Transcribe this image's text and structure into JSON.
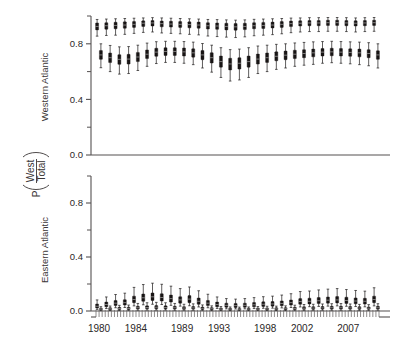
{
  "figure": {
    "axis_title": "P(West/Total)",
    "axis_title_p": "P",
    "axis_title_num": "West",
    "axis_title_den": "Total"
  },
  "chart_data": {
    "type": "box",
    "title": "",
    "xlabel": "",
    "ylabel": "P(West/Total)",
    "grid": false,
    "legend": "none",
    "panels": [
      {
        "id": "western-atlantic",
        "label": "Western Atlantic",
        "ylim": [
          0.0,
          1.0
        ],
        "yticks_major": [
          0.0,
          0.4,
          0.8
        ],
        "yticks_major_labels": [
          "0.0",
          "0.4",
          "0.8"
        ],
        "yticks_minor": [
          0.2,
          0.6,
          1.0
        ],
        "series": [
          {
            "name": "upper band",
            "x": [
              1980,
              1981,
              1982,
              1983,
              1984,
              1985,
              1986,
              1987,
              1988,
              1989,
              1990,
              1991,
              1992,
              1993,
              1994,
              1995,
              1996,
              1997,
              1998,
              1999,
              2000,
              2001,
              2002,
              2003,
              2004,
              2005,
              2006,
              2007,
              2008,
              2009,
              2010
            ],
            "median": [
              0.925,
              0.93,
              0.932,
              0.935,
              0.94,
              0.948,
              0.95,
              0.945,
              0.942,
              0.94,
              0.938,
              0.935,
              0.93,
              0.928,
              0.925,
              0.922,
              0.925,
              0.93,
              0.932,
              0.935,
              0.94,
              0.945,
              0.948,
              0.95,
              0.95,
              0.952,
              0.952,
              0.95,
              0.948,
              0.95,
              0.952
            ],
            "q1": [
              0.9,
              0.905,
              0.908,
              0.912,
              0.918,
              0.925,
              0.928,
              0.922,
              0.92,
              0.918,
              0.915,
              0.912,
              0.906,
              0.904,
              0.9,
              0.898,
              0.902,
              0.908,
              0.91,
              0.914,
              0.918,
              0.924,
              0.928,
              0.93,
              0.93,
              0.932,
              0.932,
              0.93,
              0.928,
              0.93,
              0.932
            ],
            "q3": [
              0.95,
              0.952,
              0.955,
              0.958,
              0.96,
              0.965,
              0.968,
              0.964,
              0.962,
              0.96,
              0.958,
              0.956,
              0.952,
              0.95,
              0.948,
              0.946,
              0.948,
              0.952,
              0.954,
              0.956,
              0.96,
              0.964,
              0.966,
              0.968,
              0.968,
              0.97,
              0.97,
              0.968,
              0.966,
              0.968,
              0.97
            ],
            "low": [
              0.855,
              0.86,
              0.862,
              0.868,
              0.875,
              0.882,
              0.885,
              0.878,
              0.875,
              0.872,
              0.868,
              0.864,
              0.856,
              0.852,
              0.848,
              0.845,
              0.85,
              0.858,
              0.862,
              0.866,
              0.872,
              0.88,
              0.885,
              0.888,
              0.888,
              0.89,
              0.89,
              0.888,
              0.885,
              0.888,
              0.89
            ],
            "high": [
              0.975,
              0.978,
              0.98,
              0.982,
              0.984,
              0.986,
              0.988,
              0.986,
              0.984,
              0.982,
              0.98,
              0.978,
              0.975,
              0.974,
              0.972,
              0.97,
              0.972,
              0.976,
              0.978,
              0.98,
              0.982,
              0.985,
              0.986,
              0.988,
              0.988,
              0.989,
              0.989,
              0.988,
              0.986,
              0.988,
              0.989
            ]
          },
          {
            "name": "lower band",
            "x": [
              1980,
              1981,
              1982,
              1983,
              1984,
              1985,
              1986,
              1987,
              1988,
              1989,
              1990,
              1991,
              1992,
              1993,
              1994,
              1995,
              1996,
              1997,
              1998,
              1999,
              2000,
              2001,
              2002,
              2003,
              2004,
              2005,
              2006,
              2007,
              2008,
              2009,
              2010
            ],
            "median": [
              0.72,
              0.7,
              0.688,
              0.69,
              0.705,
              0.725,
              0.74,
              0.745,
              0.745,
              0.742,
              0.735,
              0.72,
              0.7,
              0.672,
              0.655,
              0.66,
              0.672,
              0.69,
              0.7,
              0.71,
              0.718,
              0.725,
              0.73,
              0.735,
              0.74,
              0.742,
              0.74,
              0.738,
              0.735,
              0.73,
              0.72
            ],
            "q1": [
              0.688,
              0.665,
              0.652,
              0.654,
              0.672,
              0.694,
              0.71,
              0.716,
              0.716,
              0.712,
              0.704,
              0.686,
              0.662,
              0.632,
              0.612,
              0.618,
              0.632,
              0.654,
              0.666,
              0.678,
              0.686,
              0.694,
              0.7,
              0.706,
              0.712,
              0.714,
              0.712,
              0.71,
              0.706,
              0.7,
              0.688
            ],
            "q3": [
              0.752,
              0.734,
              0.722,
              0.724,
              0.738,
              0.756,
              0.768,
              0.772,
              0.772,
              0.77,
              0.764,
              0.752,
              0.736,
              0.712,
              0.696,
              0.7,
              0.712,
              0.726,
              0.734,
              0.742,
              0.748,
              0.754,
              0.758,
              0.762,
              0.766,
              0.768,
              0.766,
              0.764,
              0.762,
              0.758,
              0.75
            ],
            "low": [
              0.628,
              0.6,
              0.582,
              0.586,
              0.608,
              0.638,
              0.658,
              0.666,
              0.666,
              0.66,
              0.65,
              0.626,
              0.596,
              0.558,
              0.532,
              0.54,
              0.558,
              0.586,
              0.6,
              0.616,
              0.626,
              0.638,
              0.646,
              0.652,
              0.66,
              0.664,
              0.66,
              0.656,
              0.65,
              0.642,
              0.626
            ],
            "high": [
              0.8,
              0.788,
              0.778,
              0.78,
              0.79,
              0.805,
              0.815,
              0.818,
              0.818,
              0.816,
              0.812,
              0.802,
              0.79,
              0.772,
              0.758,
              0.762,
              0.772,
              0.784,
              0.79,
              0.796,
              0.8,
              0.806,
              0.81,
              0.814,
              0.816,
              0.818,
              0.816,
              0.814,
              0.812,
              0.808,
              0.8
            ]
          }
        ]
      },
      {
        "id": "eastern-atlantic",
        "label": "Eastern Atlantic",
        "ylim": [
          0.0,
          1.0
        ],
        "yticks_major": [
          0.0,
          0.4,
          0.8
        ],
        "yticks_major_labels": [
          "0.0",
          "0.4",
          "0.8"
        ],
        "yticks_minor": [
          0.2,
          0.6,
          1.0
        ],
        "series": [
          {
            "name": "upper band",
            "x": [
              1980,
              1981,
              1982,
              1983,
              1984,
              1985,
              1986,
              1987,
              1988,
              1989,
              1990,
              1991,
              1992,
              1993,
              1994,
              1995,
              1996,
              1997,
              1998,
              1999,
              2000,
              2001,
              2002,
              2003,
              2004,
              2005,
              2006,
              2007,
              2008,
              2009,
              2010
            ],
            "median": [
              0.035,
              0.048,
              0.058,
              0.062,
              0.085,
              0.098,
              0.105,
              0.1,
              0.092,
              0.082,
              0.088,
              0.072,
              0.058,
              0.048,
              0.042,
              0.04,
              0.042,
              0.046,
              0.05,
              0.052,
              0.056,
              0.062,
              0.07,
              0.072,
              0.076,
              0.08,
              0.082,
              0.078,
              0.074,
              0.072,
              0.085
            ],
            "q1": [
              0.022,
              0.032,
              0.04,
              0.044,
              0.062,
              0.072,
              0.078,
              0.074,
              0.066,
              0.058,
              0.062,
              0.05,
              0.04,
              0.032,
              0.028,
              0.026,
              0.028,
              0.031,
              0.034,
              0.036,
              0.039,
              0.044,
              0.05,
              0.052,
              0.055,
              0.058,
              0.06,
              0.056,
              0.053,
              0.051,
              0.062
            ],
            "q3": [
              0.052,
              0.066,
              0.078,
              0.084,
              0.11,
              0.126,
              0.134,
              0.128,
              0.118,
              0.106,
              0.114,
              0.096,
              0.078,
              0.066,
              0.058,
              0.056,
              0.058,
              0.063,
              0.068,
              0.07,
              0.075,
              0.082,
              0.092,
              0.095,
              0.1,
              0.104,
              0.107,
              0.102,
              0.097,
              0.094,
              0.11
            ],
            "low": [
              0.012,
              0.018,
              0.024,
              0.026,
              0.038,
              0.046,
              0.05,
              0.048,
              0.042,
              0.036,
              0.039,
              0.03,
              0.024,
              0.019,
              0.016,
              0.015,
              0.016,
              0.018,
              0.02,
              0.021,
              0.023,
              0.026,
              0.03,
              0.032,
              0.034,
              0.036,
              0.038,
              0.035,
              0.033,
              0.031,
              0.038
            ],
            "high": [
              0.082,
              0.104,
              0.122,
              0.132,
              0.175,
              0.196,
              0.206,
              0.198,
              0.184,
              0.166,
              0.178,
              0.15,
              0.124,
              0.104,
              0.092,
              0.088,
              0.092,
              0.099,
              0.106,
              0.11,
              0.118,
              0.128,
              0.144,
              0.148,
              0.156,
              0.162,
              0.166,
              0.159,
              0.152,
              0.147,
              0.172
            ]
          },
          {
            "name": "lower band",
            "x": [
              1980,
              1981,
              1982,
              1983,
              1984,
              1985,
              1986,
              1987,
              1988,
              1989,
              1990,
              1991,
              1992,
              1993,
              1994,
              1995,
              1996,
              1997,
              1998,
              1999,
              2000,
              2001,
              2002,
              2003,
              2004,
              2005,
              2006,
              2007,
              2008,
              2009,
              2010
            ],
            "median": [
              0.014,
              0.016,
              0.018,
              0.019,
              0.024,
              0.026,
              0.028,
              0.026,
              0.024,
              0.022,
              0.023,
              0.02,
              0.017,
              0.015,
              0.014,
              0.013,
              0.014,
              0.015,
              0.016,
              0.016,
              0.017,
              0.019,
              0.021,
              0.022,
              0.023,
              0.024,
              0.024,
              0.023,
              0.022,
              0.021,
              0.024
            ],
            "q1": [
              0.008,
              0.009,
              0.011,
              0.011,
              0.015,
              0.016,
              0.017,
              0.016,
              0.015,
              0.013,
              0.014,
              0.012,
              0.01,
              0.009,
              0.008,
              0.008,
              0.008,
              0.009,
              0.009,
              0.01,
              0.01,
              0.011,
              0.013,
              0.013,
              0.014,
              0.014,
              0.015,
              0.014,
              0.013,
              0.013,
              0.014
            ],
            "q3": [
              0.021,
              0.024,
              0.027,
              0.028,
              0.035,
              0.038,
              0.04,
              0.038,
              0.035,
              0.032,
              0.033,
              0.029,
              0.025,
              0.022,
              0.02,
              0.019,
              0.02,
              0.022,
              0.023,
              0.024,
              0.025,
              0.028,
              0.031,
              0.032,
              0.033,
              0.035,
              0.035,
              0.033,
              0.032,
              0.03,
              0.035
            ],
            "low": [
              0.003,
              0.004,
              0.004,
              0.005,
              0.006,
              0.007,
              0.007,
              0.007,
              0.006,
              0.006,
              0.006,
              0.005,
              0.004,
              0.004,
              0.003,
              0.003,
              0.003,
              0.004,
              0.004,
              0.004,
              0.004,
              0.005,
              0.005,
              0.006,
              0.006,
              0.006,
              0.006,
              0.006,
              0.005,
              0.005,
              0.006
            ],
            "high": [
              0.032,
              0.037,
              0.042,
              0.044,
              0.056,
              0.061,
              0.064,
              0.061,
              0.056,
              0.05,
              0.053,
              0.045,
              0.038,
              0.033,
              0.03,
              0.029,
              0.03,
              0.033,
              0.035,
              0.036,
              0.038,
              0.043,
              0.048,
              0.05,
              0.052,
              0.054,
              0.055,
              0.052,
              0.049,
              0.047,
              0.054
            ]
          }
        ]
      }
    ],
    "xaxis": {
      "range": [
        1979.5,
        2010.8
      ],
      "tick_labels": [
        "1980",
        "1984",
        "1989",
        "1993",
        "1998",
        "2002",
        "2007"
      ],
      "tick_label_values": [
        1980,
        1984,
        1989,
        1993,
        1998,
        2002,
        2007
      ],
      "minor_tick_count": 93
    }
  }
}
